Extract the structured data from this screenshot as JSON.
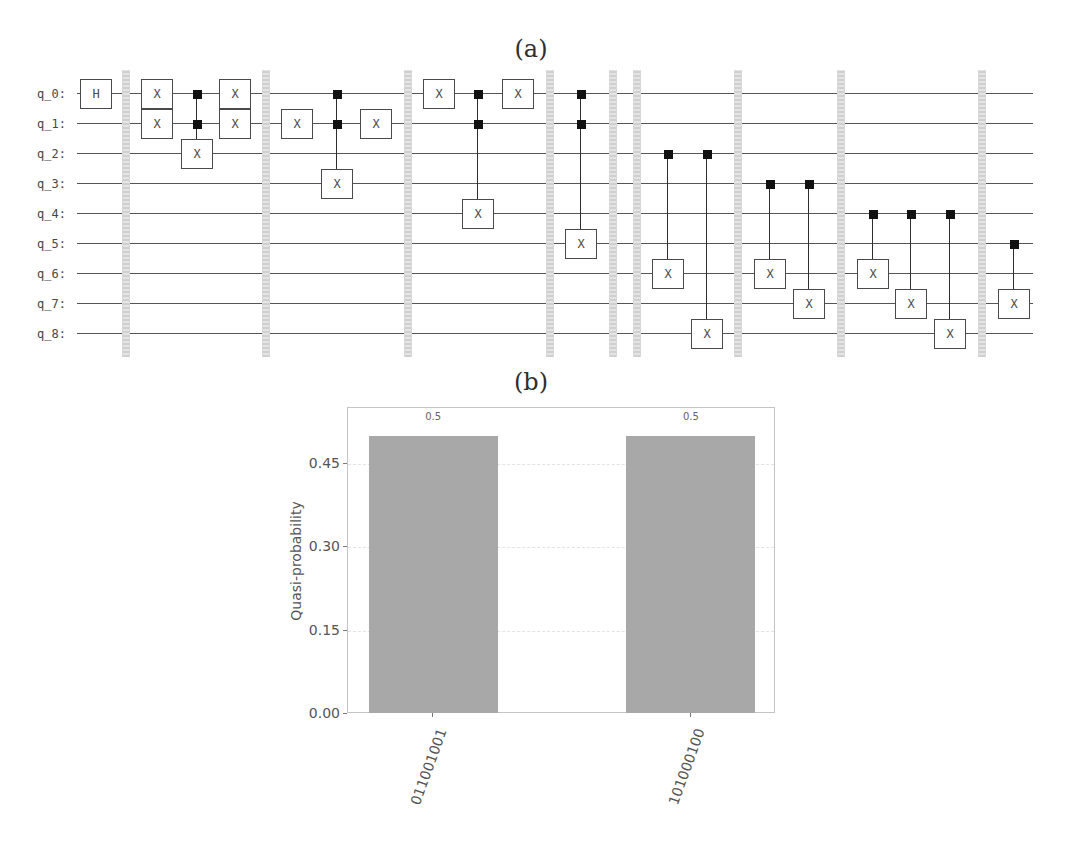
{
  "figure": {
    "panel_a_label": "(a)",
    "panel_b_label": "(b)"
  },
  "circuit": {
    "qubits": [
      "q_0:",
      "q_1:",
      "q_2:",
      "q_3:",
      "q_4:",
      "q_5:",
      "q_6:",
      "q_7:",
      "q_8:"
    ],
    "sequence": [
      {
        "kind": "gate",
        "name": "H",
        "targets": [
          0
        ]
      },
      {
        "kind": "barrier"
      },
      {
        "kind": "gate",
        "name": "X",
        "targets": [
          0,
          1
        ]
      },
      {
        "kind": "controlled",
        "name": "X",
        "controls": [
          0,
          1
        ],
        "target": 2
      },
      {
        "kind": "gate",
        "name": "X",
        "targets": [
          0,
          1
        ]
      },
      {
        "kind": "barrier"
      },
      {
        "kind": "gate",
        "name": "X",
        "targets": [
          1
        ]
      },
      {
        "kind": "controlled",
        "name": "X",
        "controls": [
          0,
          1
        ],
        "target": 3
      },
      {
        "kind": "gate",
        "name": "X",
        "targets": [
          1
        ]
      },
      {
        "kind": "barrier"
      },
      {
        "kind": "gate",
        "name": "X",
        "targets": [
          0
        ]
      },
      {
        "kind": "controlled",
        "name": "X",
        "controls": [
          0,
          1
        ],
        "target": 4
      },
      {
        "kind": "gate",
        "name": "X",
        "targets": [
          0
        ]
      },
      {
        "kind": "barrier"
      },
      {
        "kind": "controlled",
        "name": "X",
        "controls": [
          0,
          1
        ],
        "target": 5
      },
      {
        "kind": "barrier"
      },
      {
        "kind": "barrier"
      },
      {
        "kind": "controlled",
        "name": "X",
        "controls": [
          2
        ],
        "target": 6
      },
      {
        "kind": "controlled",
        "name": "X",
        "controls": [
          2
        ],
        "target": 8
      },
      {
        "kind": "barrier"
      },
      {
        "kind": "controlled",
        "name": "X",
        "controls": [
          3
        ],
        "target": 6
      },
      {
        "kind": "controlled",
        "name": "X",
        "controls": [
          3
        ],
        "target": 7
      },
      {
        "kind": "barrier"
      },
      {
        "kind": "controlled",
        "name": "X",
        "controls": [
          4
        ],
        "target": 6
      },
      {
        "kind": "controlled",
        "name": "X",
        "controls": [
          4
        ],
        "target": 7
      },
      {
        "kind": "controlled",
        "name": "X",
        "controls": [
          4
        ],
        "target": 8
      },
      {
        "kind": "barrier"
      },
      {
        "kind": "controlled",
        "name": "X",
        "controls": [
          5
        ],
        "target": 7
      }
    ],
    "colors": {
      "wire": "#555555",
      "gate_border": "#4a4a4a",
      "control": "#111111",
      "barrier": "#d6d6d6"
    }
  },
  "chart_data": {
    "type": "bar",
    "title": "",
    "categories": [
      "011001001",
      "101000100"
    ],
    "values": [
      0.5,
      0.5
    ],
    "value_labels": [
      "0.5",
      "0.5"
    ],
    "xlabel": "",
    "ylabel": "Quasi-probability",
    "ylim": [
      0,
      0.55
    ],
    "yticks": [
      0.0,
      0.15,
      0.3,
      0.45
    ],
    "ytick_labels": [
      "0.00",
      "0.15",
      "0.30",
      "0.45"
    ],
    "xlim": [
      -0.33,
      1.33
    ],
    "bar_width": 0.5,
    "xtick_rotation": 70,
    "grid": "horizontal dashed",
    "legend": null,
    "bar_color": "#a8a8a8"
  }
}
